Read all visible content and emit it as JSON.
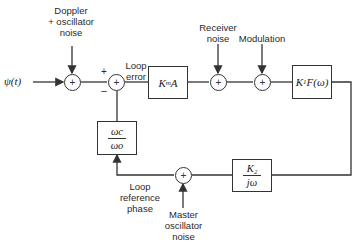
{
  "diagram": {
    "type": "block-diagram",
    "input": {
      "label": "ψ(t)"
    },
    "noise_inputs": {
      "doppler": "Doppler\n+ oscillator\nnoise",
      "receiver": "Receiver\nnoise",
      "modulation": "Modulation",
      "master": "Master\noscillator\nnoise"
    },
    "signals": {
      "loop_error": "Loop\nerror",
      "loop_reference_phase": "Loop\nreference\nphase"
    },
    "comparator_signs": {
      "plus": "+",
      "minus": "−"
    },
    "sum_symbol": "+",
    "blocks": {
      "gain": {
        "label": "K_m A",
        "main": "K",
        "sub": "m",
        "tail": " A"
      },
      "filter": {
        "label": "K_1 F(ω)",
        "main": "K",
        "sub": "1",
        "tail": " F(ω)"
      },
      "integrator": {
        "numerator": "K₂",
        "denominator": "jω"
      },
      "ratio": {
        "numerator": "ωc",
        "denominator": "ωo"
      }
    },
    "colors": {
      "line": "#333333",
      "text": "#2a2a2a",
      "background": "#ffffff"
    }
  }
}
